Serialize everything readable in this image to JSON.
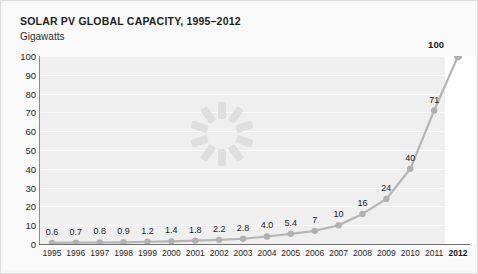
{
  "chart_data": {
    "type": "line",
    "title": "SOLAR PV GLOBAL CAPACITY, 1995–2012",
    "ylabel": "Gigawatts",
    "xlabel": "",
    "ylim": [
      0,
      100
    ],
    "ytick_labels": [
      "100",
      "90",
      "80",
      "70",
      "60",
      "50",
      "40",
      "30",
      "20",
      "10",
      "0"
    ],
    "ytick_values": [
      100,
      90,
      80,
      70,
      60,
      50,
      40,
      30,
      20,
      10,
      0
    ],
    "grid": true,
    "legend": "none",
    "categories": [
      "1995",
      "1996",
      "1997",
      "1998",
      "1999",
      "2000",
      "2001",
      "2002",
      "2003",
      "2004",
      "2005",
      "2006",
      "2007",
      "2008",
      "2009",
      "2010",
      "2011",
      "2012"
    ],
    "values": [
      0.6,
      0.7,
      0.8,
      0.9,
      1.2,
      1.4,
      1.8,
      2.2,
      2.8,
      4.0,
      5.4,
      7,
      10,
      16,
      24,
      40,
      71,
      100
    ],
    "point_labels": [
      "0.6",
      "0.7",
      "0.8",
      "0.9",
      "1.2",
      "1.4",
      "1.8",
      "2.2",
      "2.8",
      "4.0",
      "5.4",
      "7",
      "10",
      "16",
      "24",
      "40",
      "71",
      "100"
    ],
    "emphasized_category": "2012",
    "emphasized_value_label": "100",
    "series_color": "#b5b5b5",
    "marker_color": "#b0b0b0",
    "plot_background": "#efefef",
    "gridline_color": "#fbfbfb",
    "highlight_band_color": "#ffffff",
    "axis_color": "#6f6f6f",
    "text_color": "#1f1f1f"
  },
  "overlay": {
    "spinner_name": "loading-spinner",
    "spinner_spokes": 10,
    "spinner_color": "#dedede"
  }
}
